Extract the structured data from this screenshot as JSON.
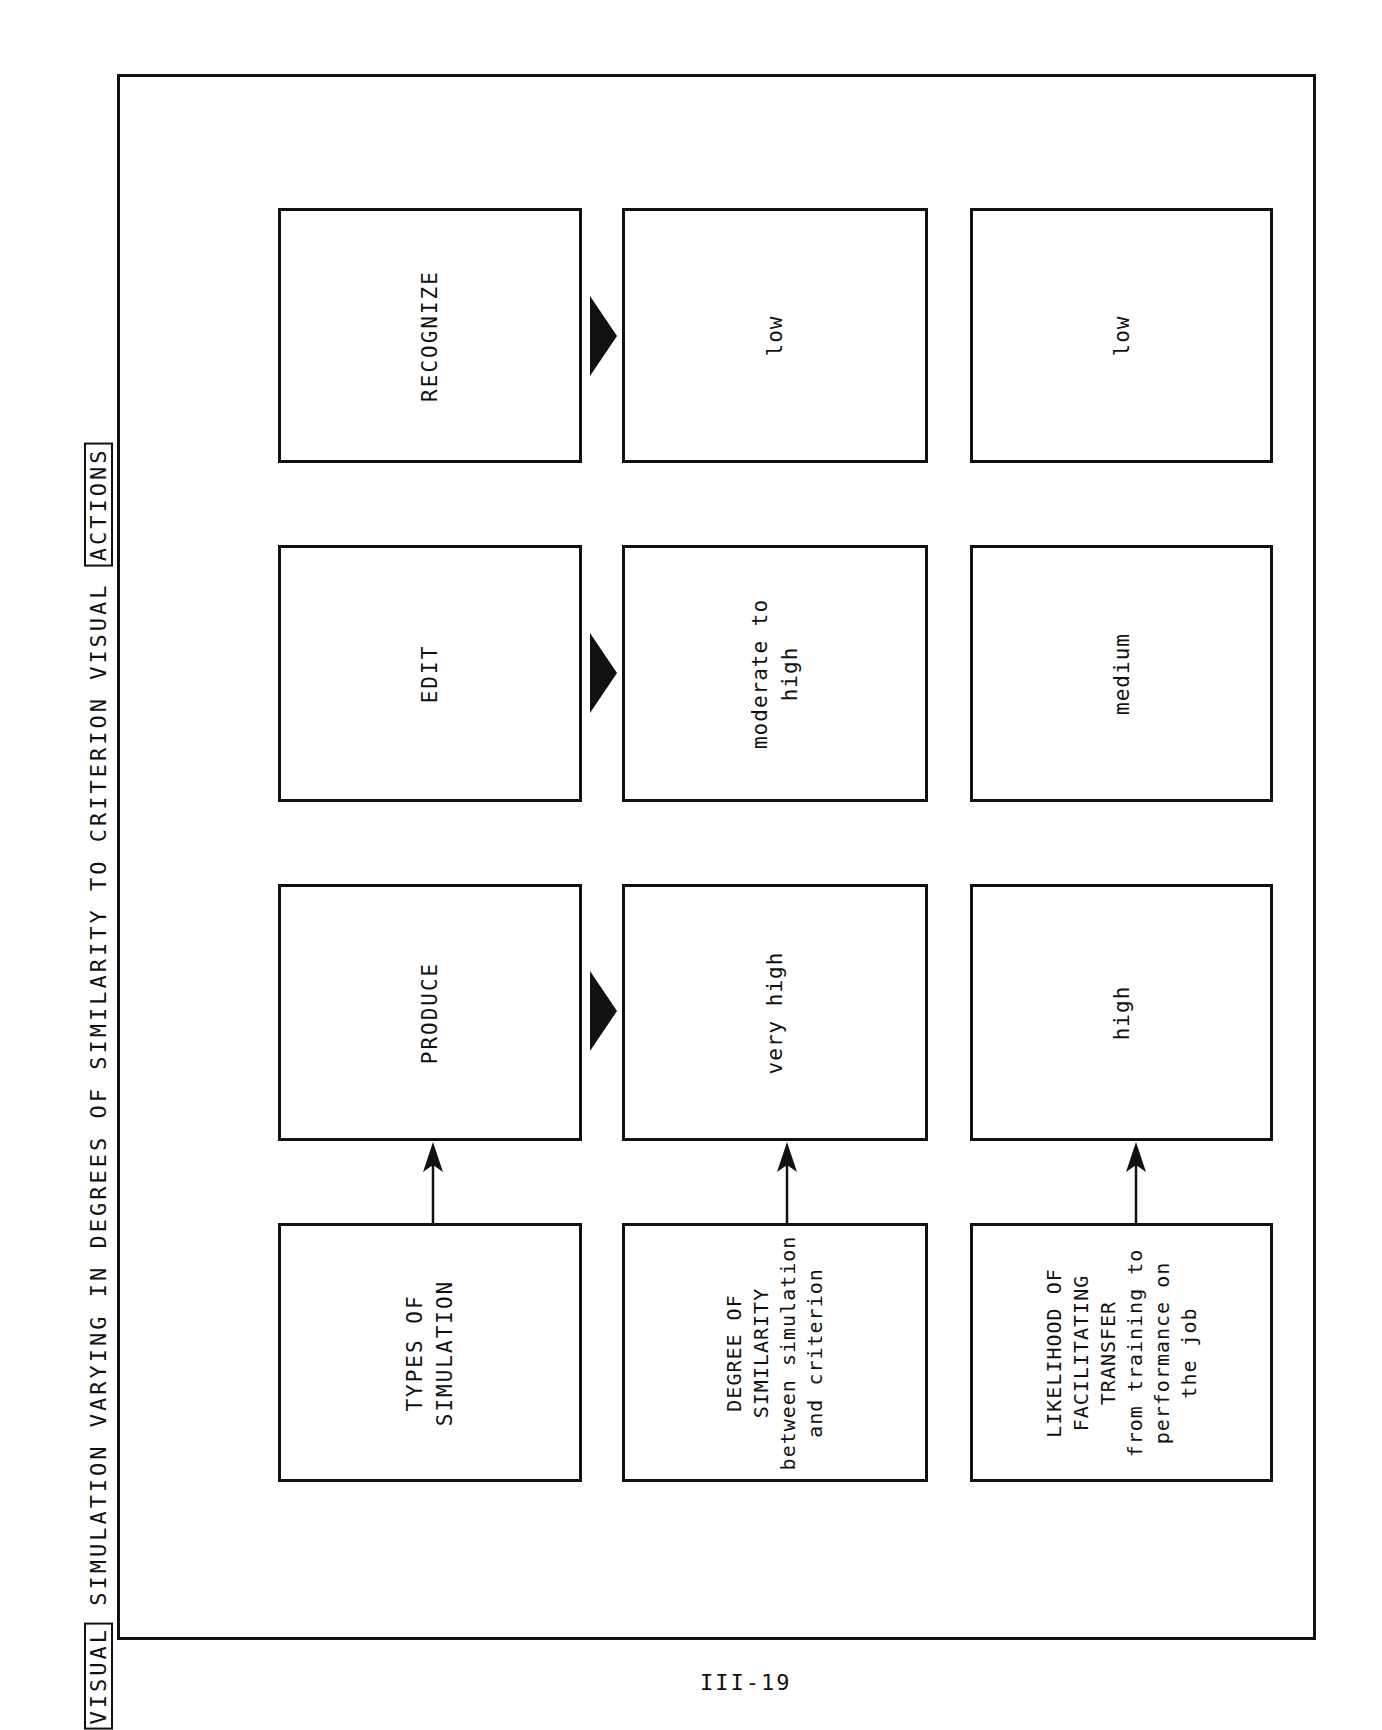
{
  "header": {
    "prefix_boxed": "VISUAL",
    "middle": " SIMULATION VARYING IN DEGREES OF SIMILARITY TO CRITERION VISUAL ",
    "suffix_boxed": "ACTIONS"
  },
  "row_labels": {
    "types": "TYPES OF\nSIMULATION",
    "similarity": "DEGREE OF\nSIMILARITY\nbetween simulation\nand criterion",
    "transfer": "LIKELIHOOD OF\nFACILITATING\nTRANSFER\nfrom training to\nperformance on\nthe job"
  },
  "simulations": [
    {
      "type": "PRODUCE",
      "similarity": "very high",
      "transfer": "high"
    },
    {
      "type": "EDIT",
      "similarity": "moderate to\nhigh",
      "transfer": "medium"
    },
    {
      "type": "RECOGNIZE",
      "similarity": "low",
      "transfer": "low"
    }
  ],
  "page_number": "III-19"
}
